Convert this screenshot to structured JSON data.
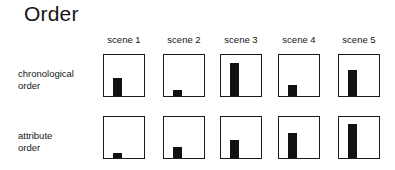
{
  "title": "Order",
  "columns": [
    {
      "label": "scene 1"
    },
    {
      "label": "scene 2"
    },
    {
      "label": "scene 3"
    },
    {
      "label": "scene 4"
    },
    {
      "label": "scene 5"
    }
  ],
  "rows": [
    {
      "label_line1": "chronological",
      "label_line2": "order"
    },
    {
      "label_line1": "attribute",
      "label_line2": "order"
    }
  ],
  "colors": {
    "bar": "#111111",
    "panel_border": "#1b1b1b",
    "background": "#ffffff",
    "text": "#161616"
  },
  "chart_data": {
    "type": "bar",
    "title": "Order",
    "xlabel": "",
    "ylabel": "",
    "grid": false,
    "legend": "none",
    "ylim": [
      0,
      1
    ],
    "categories": [
      "scene 1",
      "scene 2",
      "scene 3",
      "scene 4",
      "scene 5"
    ],
    "series": [
      {
        "name": "chronological order",
        "values": [
          0.45,
          0.14,
          0.82,
          0.28,
          0.65
        ]
      },
      {
        "name": "attribute order",
        "values": [
          0.12,
          0.28,
          0.45,
          0.62,
          0.85
        ]
      }
    ],
    "panels": [
      [
        {
          "category": "scene 1",
          "series": "chronological order",
          "value": 0.45
        },
        {
          "category": "scene 2",
          "series": "chronological order",
          "value": 0.14
        },
        {
          "category": "scene 3",
          "series": "chronological order",
          "value": 0.82
        },
        {
          "category": "scene 4",
          "series": "chronological order",
          "value": 0.28
        },
        {
          "category": "scene 5",
          "series": "chronological order",
          "value": 0.65
        }
      ],
      [
        {
          "category": "scene 1",
          "series": "attribute order",
          "value": 0.12
        },
        {
          "category": "scene 2",
          "series": "attribute order",
          "value": 0.28
        },
        {
          "category": "scene 3",
          "series": "attribute order",
          "value": 0.45
        },
        {
          "category": "scene 4",
          "series": "attribute order",
          "value": 0.62
        },
        {
          "category": "scene 5",
          "series": "attribute order",
          "value": 0.85
        }
      ]
    ],
    "bar_geometry": {
      "bar_width_frac": 0.22,
      "bar_left_frac": 0.24
    },
    "panel_layout": {
      "panel_width": 42,
      "panel_height": 43,
      "column_x": [
        103,
        163,
        220,
        278,
        338
      ],
      "row_y": [
        54,
        116
      ]
    }
  }
}
